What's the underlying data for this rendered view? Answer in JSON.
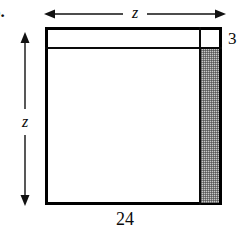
{
  "figure": {
    "problem_number": "5.",
    "shape": "rectangle",
    "labels": {
      "top_dimension": "z",
      "left_dimension": "z",
      "right_strip_width": "3",
      "bottom_side": "24"
    },
    "colors": {
      "stroke": "#000000",
      "shaded_fill": "#c9c9c9",
      "background": "#ffffff",
      "text": "#0b0b0b"
    },
    "geometry": {
      "outer_square_side_label": "z",
      "bottom_edge_value": "24",
      "border_strip_thickness": "3",
      "shaded_region": "right vertical strip of width 3, below the top strip of height 3"
    }
  }
}
